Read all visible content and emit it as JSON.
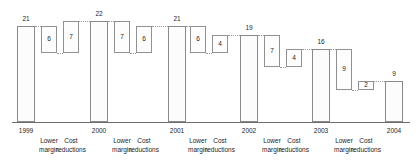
{
  "chart_data": {
    "type": "bar",
    "subtype": "waterfall",
    "title": "",
    "subtitle": "",
    "xlabel": "",
    "ylabel": "",
    "ylim": [
      0,
      22
    ],
    "grid": false,
    "legend": null,
    "connectors": "dotted",
    "categories": [
      "1999",
      "Lower margin",
      "Cost reductions",
      "2000",
      "Lower margin",
      "Cost reductions",
      "2001",
      "Lower margin",
      "Cost reductions",
      "2002",
      "Lower margin",
      "Cost reductions",
      "2003",
      "Lower margin",
      "Cost reductions",
      "2004"
    ],
    "values": [
      21,
      6,
      7,
      22,
      7,
      6,
      21,
      6,
      4,
      19,
      7,
      4,
      16,
      9,
      2,
      9
    ],
    "bars": [
      {
        "label": "1999",
        "value": 21,
        "kind": "total",
        "base": 0,
        "top": 21,
        "value_pos": "above"
      },
      {
        "label": "Lower margin",
        "value": 6,
        "kind": "delta",
        "base": 15,
        "top": 21,
        "value_pos": "inside"
      },
      {
        "label": "Cost reductions",
        "value": 7,
        "kind": "delta",
        "base": 15,
        "top": 22,
        "value_pos": "inside"
      },
      {
        "label": "2000",
        "value": 22,
        "kind": "total",
        "base": 0,
        "top": 22,
        "value_pos": "above"
      },
      {
        "label": "Lower margin",
        "value": 7,
        "kind": "delta",
        "base": 15,
        "top": 22,
        "value_pos": "inside"
      },
      {
        "label": "Cost reductions",
        "value": 6,
        "kind": "delta",
        "base": 15,
        "top": 21,
        "value_pos": "inside"
      },
      {
        "label": "2001",
        "value": 21,
        "kind": "total",
        "base": 0,
        "top": 21,
        "value_pos": "above"
      },
      {
        "label": "Lower margin",
        "value": 6,
        "kind": "delta",
        "base": 15,
        "top": 21,
        "value_pos": "inside"
      },
      {
        "label": "Cost reductions",
        "value": 4,
        "kind": "delta",
        "base": 15,
        "top": 19,
        "value_pos": "inside"
      },
      {
        "label": "2002",
        "value": 19,
        "kind": "total",
        "base": 0,
        "top": 19,
        "value_pos": "above"
      },
      {
        "label": "Lower margin",
        "value": 7,
        "kind": "delta",
        "base": 12,
        "top": 19,
        "value_pos": "inside"
      },
      {
        "label": "Cost reductions",
        "value": 4,
        "kind": "delta",
        "base": 12,
        "top": 16,
        "value_pos": "inside"
      },
      {
        "label": "2003",
        "value": 16,
        "kind": "total",
        "base": 0,
        "top": 16,
        "value_pos": "above"
      },
      {
        "label": "Lower margin",
        "value": 9,
        "kind": "delta",
        "base": 7,
        "top": 16,
        "value_pos": "inside"
      },
      {
        "label": "Cost reductions",
        "value": 2,
        "kind": "delta",
        "base": 7,
        "top": 9,
        "value_pos": "inside"
      },
      {
        "label": "2004",
        "value": 9,
        "kind": "total",
        "base": 0,
        "top": 9,
        "value_pos": "above"
      }
    ],
    "axis_ticks": [
      {
        "year": "1999",
        "line1": "",
        "line2": ""
      },
      {
        "year": "",
        "line1": "Lower",
        "line2": "margin"
      },
      {
        "year": "",
        "line1": "Cost",
        "line2": "reductions"
      },
      {
        "year": "2000",
        "line1": "",
        "line2": ""
      },
      {
        "year": "",
        "line1": "Lower",
        "line2": "margin"
      },
      {
        "year": "",
        "line1": "Cost",
        "line2": "reductions"
      },
      {
        "year": "2001",
        "line1": "",
        "line2": ""
      },
      {
        "year": "",
        "line1": "Lower",
        "line2": "margin"
      },
      {
        "year": "",
        "line1": "Cost",
        "line2": "reductions"
      },
      {
        "year": "2002",
        "line1": "",
        "line2": ""
      },
      {
        "year": "",
        "line1": "Lower",
        "line2": "margin"
      },
      {
        "year": "",
        "line1": "Cost",
        "line2": "reductions"
      },
      {
        "year": "2003",
        "line1": "",
        "line2": ""
      },
      {
        "year": "",
        "line1": "Lower",
        "line2": "margin"
      },
      {
        "year": "",
        "line1": "Cost",
        "line2": "reductions"
      },
      {
        "year": "2004",
        "line1": "",
        "line2": ""
      }
    ],
    "colors": {
      "bar_fill": "#fbfbfb",
      "bar_stroke": "#8d8d8d",
      "axis": "#6d6d6d",
      "text": "#1d1d1d",
      "connector": "#9a9a9a"
    }
  }
}
